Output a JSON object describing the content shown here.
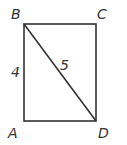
{
  "diagram": {
    "type": "rectangle-with-diagonal",
    "vertices": {
      "A": {
        "label": "A",
        "x": 24,
        "y": 121
      },
      "B": {
        "label": "B",
        "x": 24,
        "y": 24
      },
      "C": {
        "label": "C",
        "x": 96,
        "y": 24
      },
      "D": {
        "label": "D",
        "x": 96,
        "y": 121
      }
    },
    "segments": [
      {
        "from": "A",
        "to": "B",
        "length_label": "4"
      },
      {
        "from": "B",
        "to": "C"
      },
      {
        "from": "C",
        "to": "D"
      },
      {
        "from": "D",
        "to": "A"
      },
      {
        "from": "B",
        "to": "D",
        "length_label": "5"
      }
    ],
    "labels": {
      "A": "A",
      "B": "B",
      "C": "C",
      "D": "D",
      "side_AB": "4",
      "diagonal_BD": "5"
    },
    "colors": {
      "stroke": "#333333",
      "text": "#333333",
      "background": "#ffffff"
    }
  }
}
